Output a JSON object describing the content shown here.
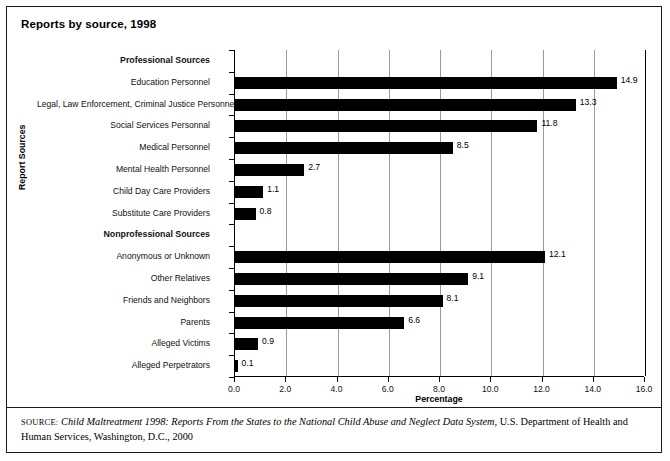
{
  "figure": {
    "title": "Reports by source, 1998",
    "source_prefix": "SOURCE:",
    "source_title": "Child Maltreatment 1998: Reports From the States to the National Child Abuse and Neglect Data System",
    "source_rest": ", U.S. Department of Health and Human Services, Washington, D.C., 2000"
  },
  "chart_data": {
    "type": "bar",
    "orientation": "horizontal",
    "title": "Reports by source, 1998",
    "xlabel": "Percentage",
    "ylabel": "Report Sources",
    "xlim": [
      0.0,
      16.0
    ],
    "xticks": [
      "0.0",
      "2.0",
      "4.0",
      "6.0",
      "8.0",
      "10.0",
      "12.0",
      "14.0",
      "16.0"
    ],
    "grid": true,
    "legend": "none",
    "categories": [
      "Professional Sources",
      "Education Personnel",
      "Legal, Law Enforcement, Criminal Justice Personnel",
      "Social Services Personnal",
      "Medical Personnel",
      "Mental Health Personnel",
      "Child Day Care Providers",
      "Substitute Care Providers",
      "Nonprofessional Sources",
      "Anonymous or Unknown",
      "Other Relatives",
      "Friends and Neighbors",
      "Parents",
      "Alleged Victims",
      "Alleged Perpetrators"
    ],
    "rows": [
      {
        "label": "Professional Sources",
        "value": null,
        "value_label": "",
        "header": true
      },
      {
        "label": "Education Personnel",
        "value": 14.9,
        "value_label": "14.9",
        "header": false
      },
      {
        "label": "Legal, Law Enforcement, Criminal Justice Personnel",
        "value": 13.3,
        "value_label": "13.3",
        "header": false
      },
      {
        "label": "Social Services Personnal",
        "value": 11.8,
        "value_label": "11.8",
        "header": false
      },
      {
        "label": "Medical Personnel",
        "value": 8.5,
        "value_label": "8.5",
        "header": false
      },
      {
        "label": "Mental Health Personnel",
        "value": 2.7,
        "value_label": "2.7",
        "header": false
      },
      {
        "label": "Child Day Care Providers",
        "value": 1.1,
        "value_label": "1.1",
        "header": false
      },
      {
        "label": "Substitute Care Providers",
        "value": 0.8,
        "value_label": "0.8",
        "header": false
      },
      {
        "label": "Nonprofessional Sources",
        "value": null,
        "value_label": "",
        "header": true
      },
      {
        "label": "Anonymous or Unknown",
        "value": 12.1,
        "value_label": "12.1",
        "header": false
      },
      {
        "label": "Other Relatives",
        "value": 9.1,
        "value_label": "9.1",
        "header": false
      },
      {
        "label": "Friends and Neighbors",
        "value": 8.1,
        "value_label": "8.1",
        "header": false
      },
      {
        "label": "Parents",
        "value": 6.6,
        "value_label": "6.6",
        "header": false
      },
      {
        "label": "Alleged Victims",
        "value": 0.9,
        "value_label": "0.9",
        "header": false
      },
      {
        "label": "Alleged Perpetrators",
        "value": 0.1,
        "value_label": "0.1",
        "header": false
      }
    ],
    "values": [
      null,
      14.9,
      13.3,
      11.8,
      8.5,
      2.7,
      1.1,
      0.8,
      null,
      12.1,
      9.1,
      8.1,
      6.6,
      0.9,
      0.1
    ],
    "colors": {
      "bar": "#000000",
      "grid": "#9a9a9a",
      "axis": "#000000",
      "background": "#ffffff"
    }
  }
}
